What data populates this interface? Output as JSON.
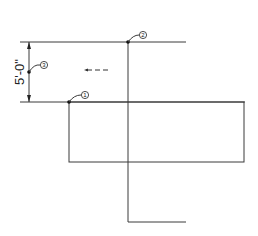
{
  "diagram": {
    "dimension": {
      "text": "5'-0\""
    },
    "points": [
      {
        "id": "1",
        "label": "1"
      },
      {
        "id": "2",
        "label": "2"
      },
      {
        "id": "3",
        "label": "3"
      }
    ],
    "direction_arrow": {
      "icon": "arrow-left-dashed-icon"
    },
    "colors": {
      "line": "#3a3a3a",
      "background": "#ffffff"
    }
  }
}
